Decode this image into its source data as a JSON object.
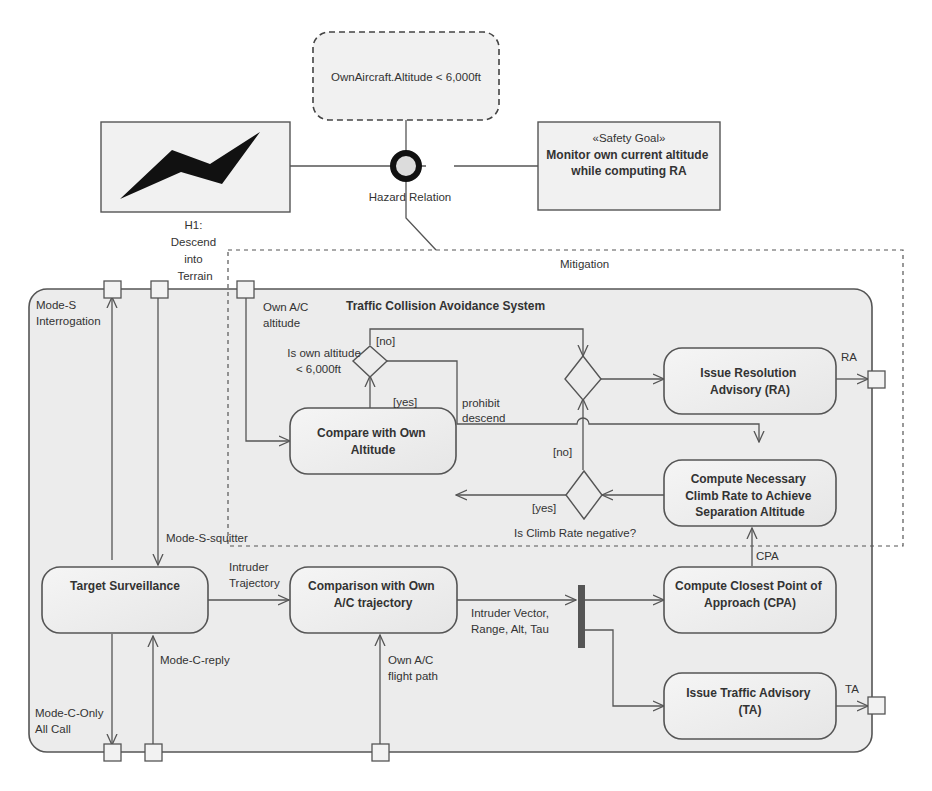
{
  "diagram": {
    "type": "SysML activity diagram with hazard relation",
    "colors": {
      "background": "#ffffff",
      "frame_fill": "#ececec",
      "node_fill": "#f1f1f1",
      "stroke": "#555555",
      "text": "#333333",
      "fork_bar": "#555555",
      "hazard_icon": "#111111"
    }
  },
  "top": {
    "condition": "OwnAircraft.Altitude < 6,000ft",
    "hazard_relation_label": "Hazard Relation",
    "hazard": {
      "icon": "lightning-icon",
      "label_lines": [
        "H1:",
        "Descend",
        "into",
        "Terrain"
      ]
    },
    "safety_goal": {
      "stereotype": "«Safety Goal»",
      "lines": [
        "Monitor own current altitude",
        "while computing RA"
      ]
    },
    "mitigation_label": "Mitigation"
  },
  "frame": {
    "title": "Traffic Collision Avoidance System",
    "pin_labels": {
      "mode_s_interrogation": [
        "Mode-S",
        "Interrogation"
      ],
      "own_ac_altitude": [
        "Own A/C",
        "altitude"
      ],
      "mode_s_squitter": "Mode-S-squitter",
      "mode_c_reply": "Mode-C-reply",
      "mode_c_only_all_call": [
        "Mode-C-Only",
        "All Call"
      ],
      "own_ac_flight_path": [
        "Own A/C",
        "flight path"
      ],
      "ra": "RA",
      "ta": "TA",
      "cpa": "CPA"
    }
  },
  "actions": {
    "issue_ra": [
      "Issue Resolution",
      "Advisory (RA)"
    ],
    "compare_altitude": [
      "Compare with Own",
      "Altitude"
    ],
    "compute_climb": [
      "Compute Necessary",
      "Climb Rate to Achieve",
      "Separation Altitude"
    ],
    "target_surveillance": [
      "Target Surveillance"
    ],
    "comparison_trajectory": [
      "Comparison with Own",
      "A/C trajectory"
    ],
    "compute_cpa": [
      "Compute Closest Point of",
      "Approach (CPA)"
    ],
    "issue_ta": [
      "Issue Traffic Advisory",
      "(TA)"
    ]
  },
  "decisions": {
    "altitude_check": {
      "question": [
        "Is own altitude",
        "< 6,000ft"
      ],
      "no": "[no]",
      "yes": "[yes]",
      "yes_flow_label": [
        "prohibit",
        "descend"
      ]
    },
    "climb_check": {
      "question": "Is Climb Rate negative?",
      "no": "[no]",
      "yes": "[yes]"
    }
  },
  "flows": {
    "intruder_trajectory": [
      "Intruder",
      "Trajectory"
    ],
    "intruder_vector": [
      "Intruder Vector,",
      "Range, Alt, Tau"
    ]
  }
}
